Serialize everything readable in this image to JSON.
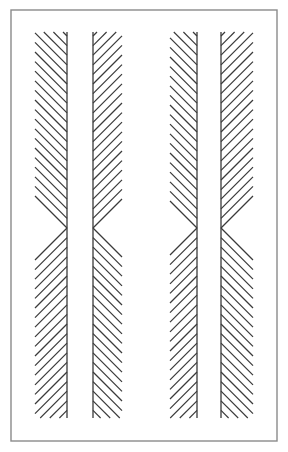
{
  "figure": {
    "type": "line-drawing",
    "canvas": {
      "width": 288,
      "height": 452,
      "background": "#ffffff"
    },
    "ink_color": "#3a3a3a",
    "border_color": "#8a8a8a"
  },
  "frame": {
    "name": "outer-border",
    "x": 11,
    "y": 10,
    "width": 266,
    "height": 431,
    "stroke": "#8a8a8a",
    "stroke_width": 1.4,
    "fill": "none"
  },
  "pattern": {
    "band_top": 32,
    "band_bottom": 418,
    "chevron_apex_y": 228,
    "hatch_spacing": 9.6,
    "hatch_stroke": "#3a3a3a",
    "hatch_stroke_width": 1.15,
    "spine_stroke_width": 1.3,
    "hatch_slope": 1.0,
    "band_count": 4,
    "group_count": 2,
    "bands": [
      {
        "id": "band-1",
        "label": "Band 1",
        "group": "left-pair",
        "spine_x": 67,
        "spine_side": "right",
        "hatch_extent": 32,
        "upper_direction": "up-right",
        "lower_direction": "down-right"
      },
      {
        "id": "band-2",
        "label": "Band 2",
        "group": "left-pair",
        "spine_x": 93,
        "spine_side": "left",
        "hatch_extent": 29,
        "upper_direction": "up-left",
        "lower_direction": "down-left"
      },
      {
        "id": "band-3",
        "label": "Band 3",
        "group": "right-pair",
        "spine_x": 197,
        "spine_side": "right",
        "hatch_extent": 27,
        "upper_direction": "up-left",
        "lower_direction": "down-left"
      },
      {
        "id": "band-4",
        "label": "Band 4",
        "group": "right-pair",
        "spine_x": 221,
        "spine_side": "left",
        "hatch_extent": 32,
        "upper_direction": "up-right",
        "lower_direction": "down-right"
      }
    ]
  }
}
